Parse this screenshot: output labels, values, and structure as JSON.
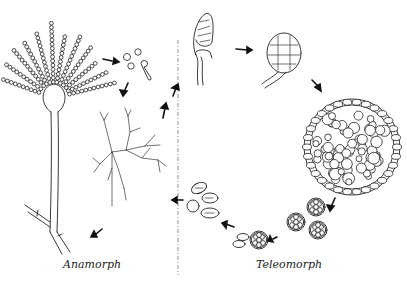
{
  "diagram": {
    "type": "life-cycle",
    "sections": [
      {
        "id": "anamorph",
        "label": "Anamorph",
        "stages": [
          "conidiophore with conidial chains",
          "conidia",
          "germinating conidium",
          "branching mycelium"
        ]
      },
      {
        "id": "teleomorph",
        "label": "Teleomorph",
        "stages": [
          "coiled ascogonium on hypha",
          "young cleistothecium",
          "mature cleistothecium",
          "asci",
          "ascus releasing ascospores",
          "ascospores"
        ]
      }
    ],
    "divider": "dashed vertical line separating anamorph and teleomorph",
    "colors": {
      "ink": "#222222",
      "background": "#ffffff",
      "divider": "#777777"
    }
  },
  "labels": {
    "anamorph": "Anamorph",
    "teleomorph": "Teleomorph"
  }
}
